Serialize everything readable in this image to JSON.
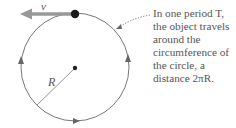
{
  "diagram": {
    "velocity_label": "v⃗",
    "radius_label": "R",
    "caption_lines": [
      "In one period T,",
      "the object travels",
      "around the",
      "circumference of",
      "the circle, a",
      "distance 2πR."
    ],
    "colors": {
      "circle": "#777777",
      "velocity_arrow": "#888888",
      "object": "#1a1a1a",
      "text": "#555555"
    }
  }
}
